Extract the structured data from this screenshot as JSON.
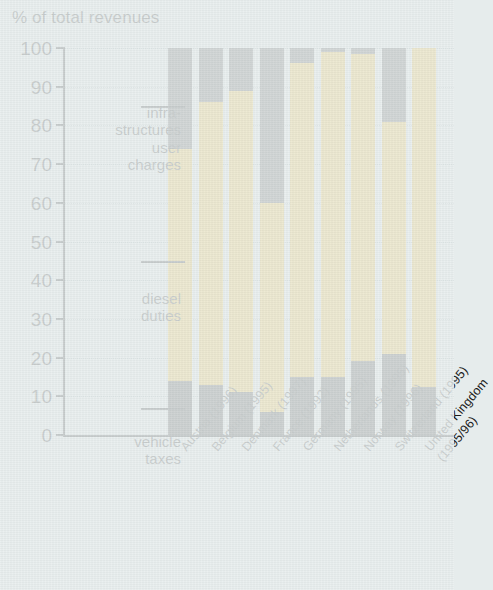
{
  "chart_data": {
    "type": "bar",
    "stacked": true,
    "title": "",
    "ylabel": "% of total revenues",
    "xlabel": "",
    "ylim": [
      0,
      100
    ],
    "ytick_labels": [
      "0",
      "10",
      "20",
      "30",
      "40",
      "50",
      "60",
      "70",
      "80",
      "90",
      "100"
    ],
    "ytick_values": [
      0,
      10,
      20,
      30,
      40,
      50,
      60,
      70,
      80,
      90,
      100
    ],
    "grid": true,
    "legend_position": "inline-annotations",
    "categories": [
      "Austria (1996)",
      "Belgium (1995)",
      "Denmark (1997)",
      "France (1992)",
      "Germany (1995)",
      "Netherlands (1995)",
      "Norway (1996)",
      "Switzerland (1995)",
      "United Kingdom (1995/96)"
    ],
    "series": [
      {
        "name": "vehicle taxes",
        "color": "#343434",
        "values": [
          14,
          13,
          11,
          6,
          15,
          15,
          19,
          21,
          12.5
        ]
      },
      {
        "name": "diesel duties",
        "color": "#fac22a",
        "values": [
          60,
          73,
          78,
          54,
          81,
          84,
          79.5,
          60,
          87.5
        ]
      },
      {
        "name": "infrastructures user charges",
        "color": "#4f4f4f",
        "values": [
          26,
          14,
          11,
          40,
          4,
          1,
          1.5,
          19,
          0
        ]
      }
    ],
    "segment_tops": {
      "vehicle_taxes": [
        14,
        13,
        11,
        6,
        15,
        15,
        19,
        21,
        12.5
      ],
      "diesel_duties_cumulative": [
        74,
        86,
        89,
        60,
        96,
        99,
        98.5,
        81,
        100
      ],
      "total": [
        100,
        100,
        100,
        100,
        100,
        100,
        100,
        100,
        100
      ]
    },
    "annotations": [
      {
        "id": "infra",
        "text": "infra-\nstructures\nuser\ncharges",
        "points_to_value": 85
      },
      {
        "id": "diesel",
        "text": "diesel\nduties",
        "points_to_value": 45
      },
      {
        "id": "vehicle",
        "text": "vehicle\ntaxes",
        "points_to_value": 7
      }
    ]
  },
  "colors": {
    "background": "#e6ecec",
    "axis": "#16181a",
    "grid": "#9fb0b4",
    "vehicle_taxes": "#343434",
    "diesel_duties": "#fac22a",
    "infrastructure_charges": "#4f4f4f"
  }
}
